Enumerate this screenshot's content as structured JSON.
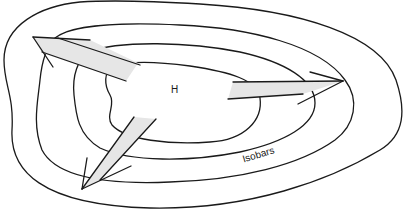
{
  "diagram": {
    "center_label": "H",
    "contour_label": "Isobars",
    "isobar_count": 4,
    "arrows": [
      {
        "name": "northwest-outflow",
        "direction": "up-left"
      },
      {
        "name": "east-outflow",
        "direction": "right"
      },
      {
        "name": "southwest-outflow",
        "direction": "down-left"
      }
    ],
    "colors": {
      "line": "#1a1a1a",
      "arrow_fill": "#e6e6e6",
      "background": "#ffffff"
    }
  }
}
